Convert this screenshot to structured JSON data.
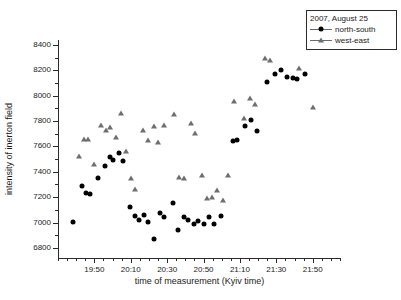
{
  "chart_data": {
    "type": "scatter",
    "title": "",
    "xlabel": "time of measurement (Kyiv time)",
    "ylabel": "intensity of inerton field",
    "grid": false,
    "legend_position": "top-right",
    "legend_title": "2007, August 25",
    "xlim": [
      1170,
      1325
    ],
    "ylim": [
      6720,
      8440
    ],
    "x_tick_labels": [
      "19:50",
      "20:10",
      "20:30",
      "20:50",
      "21:10",
      "21:30",
      "21:50"
    ],
    "x_tick_values": [
      1190,
      1210,
      1230,
      1250,
      1270,
      1290,
      1310
    ],
    "x_minor_step": 5,
    "y_tick_values": [
      6800,
      7000,
      7200,
      7400,
      7600,
      7800,
      8000,
      8200,
      8400
    ],
    "y_tick_labels": [
      "6800",
      "7000",
      "7200",
      "7400",
      "7600",
      "7800",
      "8000",
      "8200",
      "8400"
    ],
    "y_minor_step": 100,
    "series": [
      {
        "name": "north-south",
        "marker": "circle",
        "color": "#000000",
        "points": [
          [
            1178.5,
            7005
          ],
          [
            1183.0,
            7290
          ],
          [
            1185.5,
            7232
          ],
          [
            1187.5,
            7228
          ],
          [
            1192.0,
            7352
          ],
          [
            1196.0,
            7442
          ],
          [
            1198.5,
            7520
          ],
          [
            1200.5,
            7492
          ],
          [
            1203.5,
            7545
          ],
          [
            1206.0,
            7483
          ],
          [
            1209.5,
            7122
          ],
          [
            1212.5,
            7048
          ],
          [
            1214.5,
            7022
          ],
          [
            1217.0,
            7058
          ],
          [
            1219.5,
            7006
          ],
          [
            1222.5,
            6872
          ],
          [
            1226.0,
            7078
          ],
          [
            1228.0,
            7045
          ],
          [
            1233.0,
            7155
          ],
          [
            1236.0,
            6938
          ],
          [
            1239.0,
            7040
          ],
          [
            1241.5,
            7018
          ],
          [
            1244.5,
            6985
          ],
          [
            1247.0,
            7012
          ],
          [
            1250.0,
            6990
          ],
          [
            1253.0,
            7042
          ],
          [
            1256.0,
            6988
          ],
          [
            1259.5,
            7052
          ],
          [
            1266.0,
            7642
          ],
          [
            1268.5,
            7650
          ],
          [
            1273.0,
            7758
          ],
          [
            1276.0,
            7812
          ],
          [
            1279.5,
            7722
          ],
          [
            1285.0,
            8112
          ],
          [
            1289.5,
            8170
          ],
          [
            1292.5,
            8205
          ],
          [
            1296.0,
            8148
          ],
          [
            1299.0,
            8138
          ],
          [
            1301.5,
            8132
          ],
          [
            1305.5,
            8175
          ]
        ]
      },
      {
        "name": "west-east",
        "marker": "triangle",
        "color": "#6e6e6e",
        "points": [
          [
            1181.5,
            7528
          ],
          [
            1184.5,
            7660
          ],
          [
            1186.5,
            7662
          ],
          [
            1190.0,
            7460
          ],
          [
            1193.5,
            7768
          ],
          [
            1196.5,
            7733
          ],
          [
            1198.5,
            7752
          ],
          [
            1202.0,
            7678
          ],
          [
            1204.5,
            7862
          ],
          [
            1207.5,
            7568
          ],
          [
            1210.0,
            7348
          ],
          [
            1212.5,
            7268
          ],
          [
            1216.5,
            7732
          ],
          [
            1219.5,
            7652
          ],
          [
            1222.5,
            7765
          ],
          [
            1225.0,
            7635
          ],
          [
            1228.5,
            7772
          ],
          [
            1233.5,
            7855
          ],
          [
            1236.5,
            7362
          ],
          [
            1239.0,
            7348
          ],
          [
            1243.0,
            7782
          ],
          [
            1245.5,
            7705
          ],
          [
            1249.0,
            7372
          ],
          [
            1252.0,
            7195
          ],
          [
            1254.5,
            7202
          ],
          [
            1257.5,
            7260
          ],
          [
            1260.5,
            7178
          ],
          [
            1263.5,
            7372
          ],
          [
            1266.5,
            7962
          ],
          [
            1272.0,
            7822
          ],
          [
            1275.5,
            7985
          ],
          [
            1278.5,
            7938
          ],
          [
            1284.0,
            8295
          ],
          [
            1286.5,
            8282
          ],
          [
            1302.5,
            8222
          ],
          [
            1310.0,
            7915
          ]
        ]
      }
    ]
  }
}
